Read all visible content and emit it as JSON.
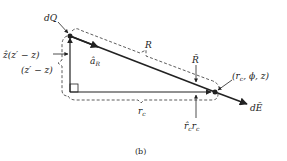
{
  "figure": {
    "caption": "(b)",
    "colors": {
      "ink": "#222222",
      "background": "#ffffff"
    },
    "labels": {
      "charge": "dQ",
      "z_vector": "ẑ(z′ − z)",
      "z_distance": "(z′ − z)",
      "unit_vector": "â",
      "unit_vector_sub": "R",
      "distance": "R",
      "vector_R": "R̄",
      "field_point": "(r",
      "field_point_sub": "c",
      "field_point_rest": ", ϕ, z)",
      "radial_distance": "r",
      "radial_distance_sub": "c",
      "radial_vector": "r̂",
      "radial_vector_sub": "c",
      "radial_vector_r": "r",
      "radial_vector_r_sub": "c",
      "field": "dĒ"
    },
    "points": {
      "source": {
        "x": 70,
        "y": 36
      },
      "corner": {
        "x": 70,
        "y": 92
      },
      "observer": {
        "x": 215,
        "y": 92
      },
      "field_tip": {
        "x": 247,
        "y": 106
      }
    }
  }
}
